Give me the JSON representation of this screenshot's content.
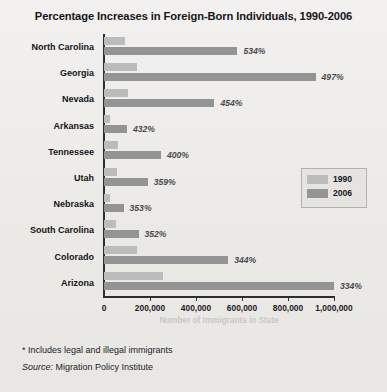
{
  "chart_data": {
    "type": "bar",
    "orientation": "horizontal",
    "title": "Percentage Increases in Foreign-Born Individuals, 1990-2006",
    "xlabel": "Number of Immigrants in State",
    "ylabel": "",
    "xlim": [
      0,
      1000000
    ],
    "xticks": [
      0,
      200000,
      400000,
      600000,
      800000,
      1000000
    ],
    "xticklabels": [
      "0",
      "200,000",
      "400,000",
      "600,000",
      "800,000",
      "1,000,000"
    ],
    "grid": false,
    "legend_position": "middle-right",
    "categories": [
      "North Carolina",
      "Georgia",
      "Nevada",
      "Arkansas",
      "Tennessee",
      "Utah",
      "Nebraska",
      "South Carolina",
      "Colorado",
      "Arizona"
    ],
    "series": [
      {
        "name": "1990",
        "color": "#bcbcbc",
        "values": [
          92000,
          145000,
          105000,
          26000,
          60000,
          57000,
          28000,
          50000,
          143000,
          257000
        ]
      },
      {
        "name": "2006",
        "color": "#949494",
        "values": [
          580000,
          920000,
          480000,
          100000,
          248000,
          190000,
          85000,
          150000,
          540000,
          1000000
        ]
      }
    ],
    "data_labels": [
      "534%",
      "497%",
      "454%",
      "432%",
      "400%",
      "359%",
      "353%",
      "352%",
      "344%",
      "334%"
    ]
  },
  "legend": {
    "items": [
      {
        "label": "1990",
        "color": "#bcbcbc"
      },
      {
        "label": "2006",
        "color": "#949494"
      }
    ]
  },
  "notes": {
    "footnote": "* Includes legal and illegal immigrants",
    "source_lead": "Source:",
    "source_value": " Migration Policy Institute"
  }
}
